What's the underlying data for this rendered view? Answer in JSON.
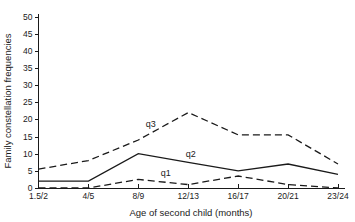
{
  "chart_data": {
    "type": "line",
    "title": "",
    "xlabel": "Age of second child (months)",
    "ylabel": "Family constellation frequencies",
    "categories": [
      "1.5/2",
      "4/5",
      "8/9",
      "12/13",
      "16/17",
      "20/21",
      "23/24"
    ],
    "ylim": [
      0,
      50
    ],
    "yticks": [
      0,
      5,
      10,
      15,
      20,
      25,
      30,
      35,
      40,
      45,
      50
    ],
    "grid": false,
    "legend_position": "inline-labels",
    "series": [
      {
        "name": "q1",
        "label": "q1",
        "style": "dashed",
        "values": [
          0,
          0,
          2.5,
          1,
          3.5,
          1,
          0
        ]
      },
      {
        "name": "q2",
        "label": "q2",
        "style": "solid",
        "values": [
          2,
          2,
          10,
          7.5,
          5,
          7,
          4
        ]
      },
      {
        "name": "q3",
        "label": "q3",
        "style": "dashed",
        "values": [
          5.5,
          8,
          14,
          22,
          15.5,
          15.5,
          7
        ]
      }
    ]
  },
  "axis": {
    "ytick_labels": [
      "0",
      "5",
      "10",
      "15",
      "20",
      "25",
      "30",
      "35",
      "40",
      "45",
      "50"
    ],
    "xtick_labels": [
      "1.5/2",
      "4/5",
      "8/9",
      "12/13",
      "16/17",
      "20/21",
      "23/24"
    ]
  },
  "labels": {
    "q1": "q1",
    "q2": "q2",
    "q3": "q3",
    "xaxis": "Age of second child (months)",
    "yaxis": "Family constellation frequencies"
  },
  "colors": {
    "ink": "#1a1a1a",
    "background": "#ffffff"
  }
}
